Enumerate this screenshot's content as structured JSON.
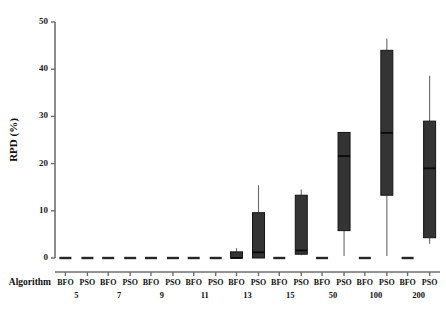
{
  "chart_data": {
    "type": "box",
    "title": "",
    "xlabel": "Algorithm",
    "ylabel": "RPD (%)",
    "ylim": [
      0,
      50
    ],
    "yticks": [
      0,
      10,
      20,
      30,
      40,
      50
    ],
    "ytick_labels": [
      "0",
      "10",
      "20",
      "30",
      "40",
      "50"
    ],
    "grid": false,
    "legend": "none",
    "categories": [
      "5",
      "7",
      "9",
      "11",
      "13",
      "15",
      "50",
      "100",
      "200"
    ],
    "algorithms": [
      "BFO",
      "PSO"
    ],
    "boxes": [
      {
        "group": "5",
        "algorithm": "BFO",
        "whisker_low": 0.0,
        "q1": 0.0,
        "median": 0.0,
        "q3": 0.0,
        "whisker_high": 0.0
      },
      {
        "group": "5",
        "algorithm": "PSO",
        "whisker_low": 0.0,
        "q1": 0.0,
        "median": 0.0,
        "q3": 0.0,
        "whisker_high": 0.0
      },
      {
        "group": "7",
        "algorithm": "BFO",
        "whisker_low": 0.0,
        "q1": 0.0,
        "median": 0.0,
        "q3": 0.0,
        "whisker_high": 0.0
      },
      {
        "group": "7",
        "algorithm": "PSO",
        "whisker_low": 0.0,
        "q1": 0.0,
        "median": 0.0,
        "q3": 0.0,
        "whisker_high": 0.0
      },
      {
        "group": "9",
        "algorithm": "BFO",
        "whisker_low": 0.0,
        "q1": 0.0,
        "median": 0.0,
        "q3": 0.0,
        "whisker_high": 0.0
      },
      {
        "group": "9",
        "algorithm": "PSO",
        "whisker_low": 0.0,
        "q1": 0.0,
        "median": 0.0,
        "q3": 0.0,
        "whisker_high": 0.0
      },
      {
        "group": "11",
        "algorithm": "BFO",
        "whisker_low": 0.0,
        "q1": 0.0,
        "median": 0.0,
        "q3": 0.0,
        "whisker_high": 0.0
      },
      {
        "group": "11",
        "algorithm": "PSO",
        "whisker_low": 0.0,
        "q1": 0.0,
        "median": 0.0,
        "q3": 0.0,
        "whisker_high": 0.0
      },
      {
        "group": "13",
        "algorithm": "BFO",
        "whisker_low": 0.0,
        "q1": 0.0,
        "median": 0.0,
        "q3": 1.3,
        "whisker_high": 2.1
      },
      {
        "group": "13",
        "algorithm": "PSO",
        "whisker_low": 0.0,
        "q1": 0.0,
        "median": 1.2,
        "q3": 9.6,
        "whisker_high": 15.4
      },
      {
        "group": "15",
        "algorithm": "BFO",
        "whisker_low": 0.0,
        "q1": 0.0,
        "median": 0.0,
        "q3": 0.0,
        "whisker_high": 0.0
      },
      {
        "group": "15",
        "algorithm": "PSO",
        "whisker_low": 0.6,
        "q1": 0.8,
        "median": 1.6,
        "q3": 13.3,
        "whisker_high": 14.5
      },
      {
        "group": "50",
        "algorithm": "BFO",
        "whisker_low": 0.0,
        "q1": 0.0,
        "median": 0.0,
        "q3": 0.0,
        "whisker_high": 0.0
      },
      {
        "group": "50",
        "algorithm": "PSO",
        "whisker_low": 0.4,
        "q1": 5.8,
        "median": 21.6,
        "q3": 26.6,
        "whisker_high": 26.6
      },
      {
        "group": "100",
        "algorithm": "BFO",
        "whisker_low": 0.0,
        "q1": 0.0,
        "median": 0.0,
        "q3": 0.0,
        "whisker_high": 0.0
      },
      {
        "group": "100",
        "algorithm": "PSO",
        "whisker_low": 0.4,
        "q1": 13.3,
        "median": 26.5,
        "q3": 44.0,
        "whisker_high": 46.5
      },
      {
        "group": "200",
        "algorithm": "BFO",
        "whisker_low": 0.0,
        "q1": 0.0,
        "median": 0.0,
        "q3": 0.0,
        "whisker_high": 0.0
      },
      {
        "group": "200",
        "algorithm": "PSO",
        "whisker_low": 3.0,
        "q1": 4.3,
        "median": 19.0,
        "q3": 29.0,
        "whisker_high": 38.6
      }
    ]
  },
  "axes": {
    "y_label": "RPD (%)",
    "x_axis_title": "Algorithm",
    "y_ticks": [
      "0",
      "10",
      "20",
      "30",
      "40",
      "50"
    ],
    "group_labels": [
      "5",
      "7",
      "9",
      "11",
      "13",
      "15",
      "50",
      "100",
      "200"
    ],
    "algorithm_labels": [
      "BFO",
      "PSO"
    ]
  },
  "colors": {
    "box_fill": "#343434",
    "box_edge": "#141414",
    "median": "#0a0a0a",
    "whisker": "#6a6a6a",
    "axis": "#6e6e6e",
    "text": "#111111",
    "background": "#ffffff"
  }
}
